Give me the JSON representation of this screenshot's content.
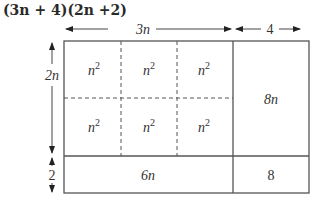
{
  "title": "(3n + 4)(2n +2)",
  "dimensions": {
    "top": [
      {
        "label": "3n",
        "from_x": 65,
        "to_x": 232
      },
      {
        "label": "4",
        "from_x": 235,
        "to_x": 301
      }
    ],
    "left": [
      {
        "label": "2n",
        "from_y": 42,
        "to_y": 154
      },
      {
        "label": "2",
        "from_y": 158,
        "to_y": 192
      }
    ]
  },
  "cells": {
    "n2_label": "n",
    "n2_exp": "2",
    "r1c1": "n2",
    "r1c2": "n2",
    "r1c3": "n2",
    "r2c1": "n2",
    "r2c2": "n2",
    "r2c3": "n2",
    "right_top": "8n",
    "bottom_left": "6n",
    "bottom_right": "8"
  },
  "colors": {
    "line": "#555555",
    "text": "#333333"
  }
}
